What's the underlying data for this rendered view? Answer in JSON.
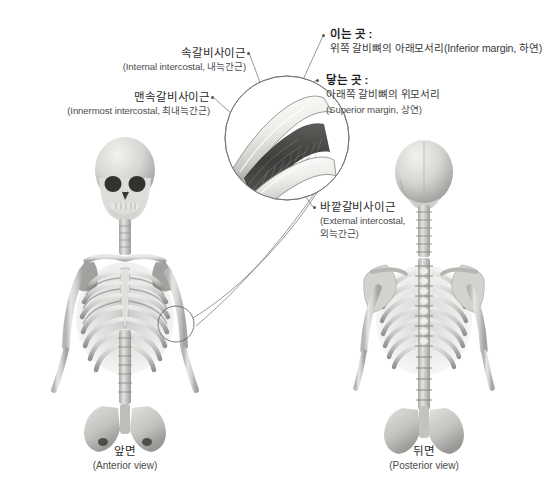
{
  "figure": {
    "background_color": "#ffffff",
    "line_color": "#6b6b6b",
    "text_color": "#2b2b2b"
  },
  "labels": {
    "internal_intercostal": {
      "kr": "속갈비사이근",
      "en": "(Internal intercostal, 내늑간근)"
    },
    "innermost_intercostal": {
      "kr": "맨속갈비사이근",
      "en": "(Innermost intercostal, 최내늑간근)"
    },
    "external_intercostal": {
      "kr": "바깥갈비사이근",
      "en_line1": "(External intercostal,",
      "en_line2": "외늑간근)"
    },
    "origin": {
      "heading": "이는 곳 :",
      "detail": "위쪽 갈비뼈의 아래모서리(Inferior margin, 하연)"
    },
    "insertion": {
      "heading": "닿는 곳 :",
      "detail_line1": "아래쪽 갈비뼈의 위모서리",
      "detail_line2": "(Superior margin, 상연)"
    }
  },
  "captions": {
    "anterior": {
      "kr": "앞면",
      "en": "(Anterior view)"
    },
    "posterior": {
      "kr": "뒤면",
      "en": "(Posterior view)"
    }
  },
  "inset": {
    "name": "intercostal-muscle-magnified-detail",
    "description": "확대 원형 삽입도: 위아래 갈비뼈 사이의 갈비사이근 섬유",
    "rib_color": "#ededea",
    "muscle_color": "#4a4a4a"
  },
  "illustrations": {
    "anterior_skeleton": "앞면 뼈대",
    "posterior_skeleton": "뒤면 뼈대"
  }
}
